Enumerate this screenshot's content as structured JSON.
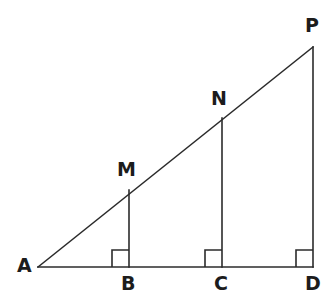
{
  "figure": {
    "type": "geometry-diagram",
    "background_color": "#ffffff",
    "stroke_color": "#2b2b2b",
    "label_color": "#1c1c1c",
    "stroke_width": 1.6,
    "canvas": {
      "width": 336,
      "height": 304
    }
  },
  "points": [
    {
      "id": "A",
      "label": "A",
      "x": 38,
      "y": 267,
      "label_x": 17,
      "label_y": 256
    },
    {
      "id": "B",
      "label": "B",
      "x": 129,
      "y": 267,
      "label_x": 121,
      "label_y": 274
    },
    {
      "id": "C",
      "label": "C",
      "x": 222,
      "y": 267,
      "label_x": 214,
      "label_y": 274
    },
    {
      "id": "D",
      "label": "D",
      "x": 313,
      "y": 267,
      "label_x": 305,
      "label_y": 274
    },
    {
      "id": "M",
      "label": "M",
      "x": 129,
      "y": 190,
      "label_x": 117,
      "label_y": 160
    },
    {
      "id": "N",
      "label": "N",
      "x": 222,
      "y": 118,
      "label_x": 211,
      "label_y": 89
    },
    {
      "id": "P",
      "label": "P",
      "x": 313,
      "y": 47,
      "label_x": 305,
      "label_y": 16
    }
  ],
  "segments": [
    {
      "id": "AP",
      "name": "hypotenuse-AP",
      "from": "A",
      "to": "P",
      "x1": 38,
      "y1": 267,
      "x2": 313,
      "y2": 47
    },
    {
      "id": "AD",
      "name": "base-AD",
      "from": "A",
      "to": "D",
      "x1": 38,
      "y1": 267,
      "x2": 313,
      "y2": 267
    },
    {
      "id": "MB",
      "name": "perpendicular-MB",
      "from": "M",
      "to": "B",
      "x1": 129,
      "y1": 190,
      "x2": 129,
      "y2": 267
    },
    {
      "id": "NC",
      "name": "perpendicular-NC",
      "from": "N",
      "to": "C",
      "x1": 222,
      "y1": 118,
      "x2": 222,
      "y2": 267
    },
    {
      "id": "PD",
      "name": "perpendicular-PD",
      "from": "P",
      "to": "D",
      "x1": 313,
      "y1": 47,
      "x2": 313,
      "y2": 267
    }
  ],
  "right_angle_marks": [
    {
      "id": "angle-at-B",
      "vertex": "B",
      "size": 17,
      "corner_x": 112,
      "corner_y": 250
    },
    {
      "id": "angle-at-C",
      "vertex": "C",
      "size": 17,
      "corner_x": 205,
      "corner_y": 250
    },
    {
      "id": "angle-at-D",
      "vertex": "D",
      "size": 17,
      "corner_x": 296,
      "corner_y": 250
    }
  ]
}
